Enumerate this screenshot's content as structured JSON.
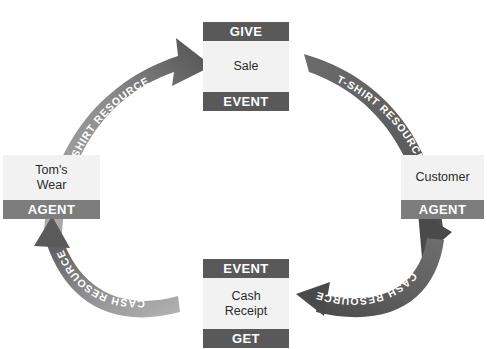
{
  "diagram": {
    "background": "#ffffff",
    "colors": {
      "bar_dark": "#595959",
      "bar_light": "#7d7d7d",
      "box_body": "#f2f2f2",
      "arrow_dark": "#595959",
      "arrow_light": "#a6a6a6",
      "label_text": "#ffffff",
      "body_text": "#2b2b2b"
    },
    "boxes": [
      {
        "id": "sale",
        "header": "GIVE",
        "body_lines": [
          "Sale"
        ],
        "footer": "EVENT",
        "position": "top"
      },
      {
        "id": "toms_wear",
        "header": "",
        "body_lines": [
          "Tom's",
          "Wear"
        ],
        "footer": "AGENT",
        "position": "left"
      },
      {
        "id": "customer",
        "header": "",
        "body_lines": [
          "Customer"
        ],
        "footer": "AGENT",
        "position": "right"
      },
      {
        "id": "cash_receipt",
        "header": "EVENT",
        "body_lines": [
          "Cash",
          "Receipt"
        ],
        "footer": "GET",
        "position": "bottom"
      }
    ],
    "arrows": [
      {
        "id": "toms-to-sale",
        "label": "T-SHIRT  RESOURCE",
        "from": "toms_wear",
        "to": "sale",
        "direction": "up-right"
      },
      {
        "id": "sale-to-customer",
        "label": "T-SHIRT  RESOURCE",
        "from": "sale",
        "to": "customer",
        "direction": "down-right"
      },
      {
        "id": "customer-to-cash",
        "label": "CASH  RESOURCE",
        "from": "customer",
        "to": "cash_receipt",
        "direction": "down-left"
      },
      {
        "id": "cash-to-toms",
        "label": "CASH  RESOURCE",
        "from": "cash_receipt",
        "to": "toms_wear",
        "direction": "up-left"
      }
    ]
  }
}
